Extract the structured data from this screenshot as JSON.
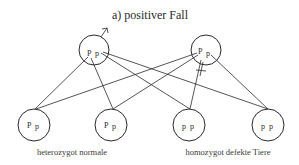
{
  "title": "a) positiver Fall",
  "parents": [
    {
      "id": "male",
      "sex_symbol": "male-symbol",
      "alleles": [
        "P",
        "p"
      ],
      "cx": 94,
      "cy": 50
    },
    {
      "id": "female",
      "sex_symbol": "female-symbol",
      "alleles": [
        "P",
        "p"
      ],
      "cx": 206,
      "cy": 50
    }
  ],
  "offspring": [
    {
      "alleles": [
        "P",
        "p"
      ],
      "cx": 34,
      "cy": 125
    },
    {
      "alleles": [
        "P",
        "p"
      ],
      "cx": 111,
      "cy": 125
    },
    {
      "alleles": [
        "p",
        "p"
      ],
      "cx": 189,
      "cy": 125
    },
    {
      "alleles": [
        "p",
        "p"
      ],
      "cx": 268,
      "cy": 125
    }
  ],
  "labels": {
    "left": "heterozygot normale",
    "right": "homozygot defekte Tiere"
  }
}
